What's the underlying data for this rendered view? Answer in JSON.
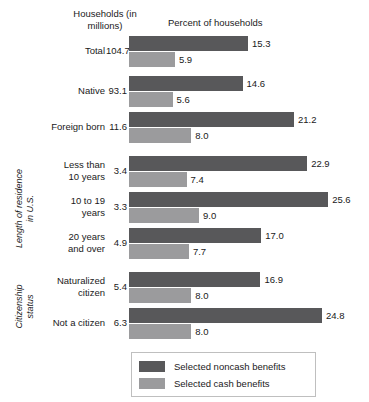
{
  "header": {
    "households_label": "Households\n(in millions)",
    "percent_label": "Percent of households"
  },
  "group_labels": [
    {
      "text": "Length of residence\nin U.S.",
      "rows": [
        3,
        4,
        5
      ]
    },
    {
      "text": "Citizenship\nstatus",
      "rows": [
        6,
        7
      ]
    }
  ],
  "legend": {
    "items": [
      {
        "label": "Selected noncash benefits",
        "color": "#58585a"
      },
      {
        "label": "Selected cash benefits",
        "color": "#9b9b9d"
      }
    ]
  },
  "colors": {
    "noncash": "#58585a",
    "cash": "#9b9b9d",
    "text": "#1a1a1a",
    "legend_border": "#bfbfbf",
    "background": "#ffffff"
  },
  "chart_data": {
    "type": "bar",
    "orientation": "horizontal",
    "title": "",
    "subtitle": "",
    "xlabel": "Percent of households",
    "ylabel": "",
    "xlim": [
      0,
      25.6
    ],
    "grid": false,
    "legend_position": "bottom",
    "value_label_format": "one-decimal",
    "secondary_column": {
      "header": "Households\n(in millions)",
      "values": [
        104.7,
        93.1,
        11.6,
        3.4,
        3.3,
        4.9,
        5.4,
        6.3
      ]
    },
    "categories": [
      "Total",
      "Native",
      "Foreign born",
      "Less than\n10 years",
      "10 to 19\nyears",
      "20 years\nand over",
      "Naturalized\ncitizen",
      "Not a citizen"
    ],
    "series": [
      {
        "name": "Selected noncash benefits",
        "color": "#58585a",
        "values": [
          15.3,
          14.6,
          21.2,
          22.9,
          25.6,
          17.0,
          16.9,
          24.8
        ]
      },
      {
        "name": "Selected cash benefits",
        "color": "#9b9b9d",
        "values": [
          5.9,
          5.6,
          8.0,
          7.4,
          9.0,
          7.7,
          8.0,
          8.0
        ]
      }
    ],
    "groups": [
      {
        "label": "",
        "categories": [
          "Total",
          "Native",
          "Foreign born"
        ]
      },
      {
        "label": "Length of residence in U.S.",
        "categories": [
          "Less than 10 years",
          "10 to 19 years",
          "20 years and over"
        ]
      },
      {
        "label": "Citizenship status",
        "categories": [
          "Naturalized citizen",
          "Not a citizen"
        ]
      }
    ]
  },
  "rows": [
    {
      "label": "Total",
      "lines": 1,
      "count": "104.7",
      "noncash": "15.3",
      "cash": "5.9",
      "top": 36
    },
    {
      "label": "Native",
      "lines": 1,
      "count": "93.1",
      "noncash": "14.6",
      "cash": "5.6",
      "top": 76
    },
    {
      "label": "Foreign born",
      "lines": 1,
      "count": "11.6",
      "noncash": "21.2",
      "cash": "8.0",
      "top": 112
    },
    {
      "label": "Less than\n10 years",
      "lines": 2,
      "count": "3.4",
      "noncash": "22.9",
      "cash": "7.4",
      "top": 156
    },
    {
      "label": "10 to 19\nyears",
      "lines": 2,
      "count": "3.3",
      "noncash": "25.6",
      "cash": "9.0",
      "top": 192
    },
    {
      "label": "20 years\nand over",
      "lines": 2,
      "count": "4.9",
      "noncash": "17.0",
      "cash": "7.7",
      "top": 228
    },
    {
      "label": "Naturalized\ncitizen",
      "lines": 2,
      "count": "5.4",
      "noncash": "16.9",
      "cash": "8.0",
      "top": 272
    },
    {
      "label": "Not a citizen",
      "lines": 1,
      "count": "6.3",
      "noncash": "24.8",
      "cash": "8.0",
      "top": 308
    }
  ]
}
